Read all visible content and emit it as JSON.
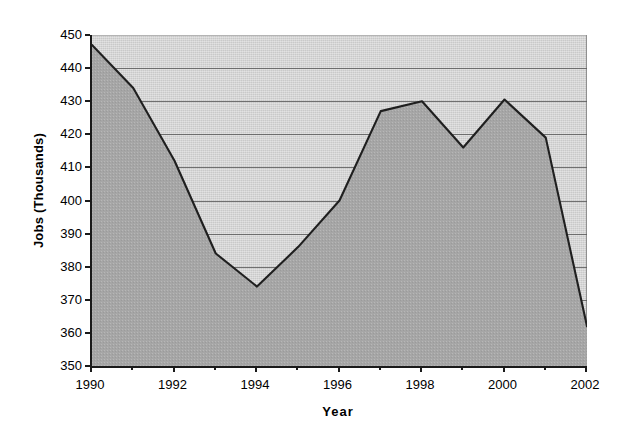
{
  "chart_data": {
    "type": "area",
    "title": "",
    "xlabel": "Year",
    "ylabel": "Jobs (Thousands)",
    "x": [
      1990,
      1991,
      1992,
      1993,
      1994,
      1995,
      1996,
      1997,
      1998,
      1999,
      2000,
      2001,
      2002
    ],
    "values": [
      447,
      434,
      412,
      384,
      374,
      386,
      400,
      427,
      430,
      416,
      430.5,
      419,
      362
    ],
    "series": [
      {
        "name": "Jobs",
        "values": [
          447,
          434,
          412,
          384,
          374,
          386,
          400,
          427,
          430,
          416,
          430.5,
          419,
          362
        ]
      }
    ],
    "xlim": [
      1990,
      2002
    ],
    "ylim": [
      350,
      450
    ],
    "ytick_labels": [
      "450",
      "440",
      "430",
      "420",
      "410",
      "400",
      "390",
      "380",
      "370",
      "360",
      "350"
    ],
    "ytick_values": [
      450,
      440,
      430,
      420,
      410,
      400,
      390,
      380,
      370,
      360,
      350
    ],
    "xtick_labels": [
      "1990",
      "1992",
      "1994",
      "1996",
      "1998",
      "2000",
      "2002"
    ],
    "xtick_values": [
      1990,
      1992,
      1994,
      1996,
      1998,
      2000,
      2002
    ],
    "xtick_minor_values": [
      1991,
      1993,
      1995,
      1997,
      1999,
      2001
    ],
    "grid": true,
    "legend": "none",
    "colors": {
      "plot_background": "#c9c9c9",
      "area_fill": "#a6a6a6",
      "line": "#1f1f1f",
      "gridline": "#5c5c5c",
      "axis": "#1a1a1a",
      "text": "#000000"
    }
  }
}
